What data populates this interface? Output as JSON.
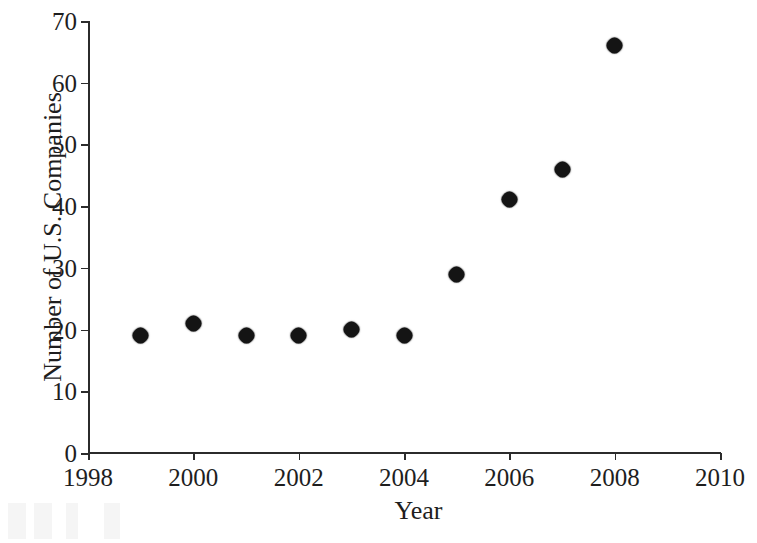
{
  "chart_data": {
    "type": "scatter",
    "title": "",
    "xlabel": "Year",
    "ylabel": "Number of U.S. Companies",
    "xlim": [
      1998,
      2010
    ],
    "ylim": [
      0,
      70
    ],
    "grid": false,
    "legend": "none",
    "marker": "filled-diamond",
    "marker_color": "#141414",
    "x_ticks": [
      1998,
      2000,
      2002,
      2004,
      2006,
      2008,
      2010
    ],
    "x_tick_labels": [
      "1998",
      "2000",
      "2002",
      "2004",
      "2006",
      "2008",
      "2010"
    ],
    "y_ticks": [
      0,
      10,
      20,
      30,
      40,
      50,
      60,
      70
    ],
    "y_tick_labels": [
      "0",
      "10",
      "20",
      "30",
      "40",
      "50",
      "60",
      "70"
    ],
    "x": [
      1999,
      2000,
      2001,
      2002,
      2003,
      2004,
      2005,
      2006,
      2007,
      2008
    ],
    "values": [
      19,
      21,
      19,
      19,
      20,
      19,
      29,
      41,
      46,
      66
    ],
    "points": [
      {
        "x": 1999,
        "y": 19
      },
      {
        "x": 2000,
        "y": 21
      },
      {
        "x": 2001,
        "y": 19
      },
      {
        "x": 2002,
        "y": 19
      },
      {
        "x": 2003,
        "y": 20
      },
      {
        "x": 2004,
        "y": 19
      },
      {
        "x": 2005,
        "y": 29
      },
      {
        "x": 2006,
        "y": 41
      },
      {
        "x": 2007,
        "y": 46
      },
      {
        "x": 2008,
        "y": 66
      }
    ]
  },
  "colors": {
    "background": "#ffffff",
    "axis": "#2b2b2b",
    "text": "#1e1e1e",
    "marker": "#141414"
  }
}
